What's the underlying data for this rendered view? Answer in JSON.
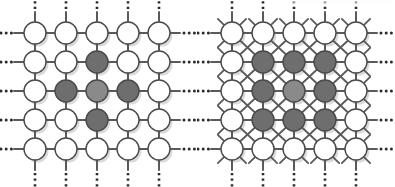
{
  "figure": {
    "background_color": "#ffffff",
    "panel_count": 2
  },
  "style": {
    "node_fill_empty": "#ffffff",
    "node_fill_dark": "#6e6e6e",
    "node_fill_center": "#8a8a8a",
    "node_stroke": "#4a4a4a",
    "edge_color": "#5a5a5a",
    "shadow_color": "#bdbdbd",
    "ellipsis_color": "#2b2b2b",
    "node_radius": 11,
    "node_stroke_width": 1.4,
    "edge_width": 2.0,
    "diagonal_edge_width": 1.8
  },
  "panels": [
    {
      "name": "von-neumann-lattice",
      "connectivity": "4-neighbor",
      "has_diagonal_edges": false,
      "grid": {
        "rows": 5,
        "cols": 5,
        "col_x": [
          35,
          66,
          97,
          128,
          159
        ],
        "row_y": [
          33,
          62,
          91,
          120,
          149
        ],
        "origin_x": 0,
        "origin_y": 0,
        "width": 197,
        "height": 187
      },
      "selected_shape": "plus",
      "node_states": [
        [
          "empty",
          "empty",
          "empty",
          "empty",
          "empty"
        ],
        [
          "empty",
          "empty",
          "dark",
          "empty",
          "empty"
        ],
        [
          "empty",
          "dark",
          "center",
          "dark",
          "empty"
        ],
        [
          "empty",
          "empty",
          "dark",
          "empty",
          "empty"
        ],
        [
          "empty",
          "empty",
          "empty",
          "empty",
          "empty"
        ]
      ],
      "continuation_marks": {
        "left_ellipsis_rows": [
          0,
          1,
          2,
          3,
          4
        ],
        "right_ellipsis_rows": [
          0,
          1,
          2,
          3,
          4
        ],
        "top_dotted_cols": [
          0,
          1,
          2,
          3,
          4
        ],
        "bottom_dotted_cols": [
          0,
          1,
          2,
          3,
          4
        ],
        "ellipsis_glyph": "•••"
      }
    },
    {
      "name": "moore-lattice",
      "connectivity": "8-neighbor",
      "has_diagonal_edges": true,
      "grid": {
        "rows": 5,
        "cols": 5,
        "col_x": [
          35,
          66,
          97,
          128,
          159
        ],
        "row_y": [
          33,
          62,
          91,
          120,
          149
        ],
        "origin_x": 197,
        "origin_y": 0,
        "width": 198,
        "height": 187
      },
      "selected_shape": "block-3x3",
      "node_states": [
        [
          "empty",
          "empty",
          "empty",
          "empty",
          "empty"
        ],
        [
          "empty",
          "dark",
          "dark",
          "dark",
          "empty"
        ],
        [
          "empty",
          "dark",
          "center",
          "dark",
          "empty"
        ],
        [
          "empty",
          "dark",
          "dark",
          "dark",
          "empty"
        ],
        [
          "empty",
          "empty",
          "empty",
          "empty",
          "empty"
        ]
      ],
      "continuation_marks": {
        "left_ellipsis_rows": [
          0,
          1,
          2,
          3,
          4
        ],
        "right_ellipsis_rows": [
          0,
          1,
          2,
          3,
          4
        ],
        "top_dotted_cols": [
          0,
          1,
          2,
          3,
          4
        ],
        "bottom_dotted_cols": [
          0,
          1,
          2,
          3,
          4
        ],
        "ellipsis_glyph": "•••"
      }
    }
  ]
}
